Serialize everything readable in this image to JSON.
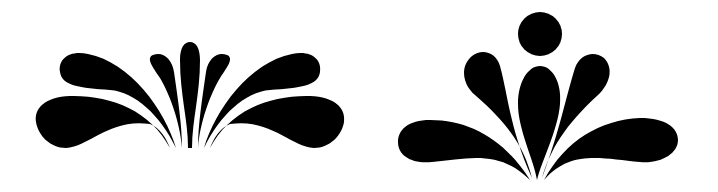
{
  "image": {
    "description": "Two black decorative floral/splash ornaments on white background",
    "background": "#ffffff",
    "fill": "#000000",
    "ornaments": [
      {
        "name": "left-ornament",
        "petals": 9
      },
      {
        "name": "right-ornament",
        "petals": 5,
        "has_circle": true
      }
    ]
  }
}
